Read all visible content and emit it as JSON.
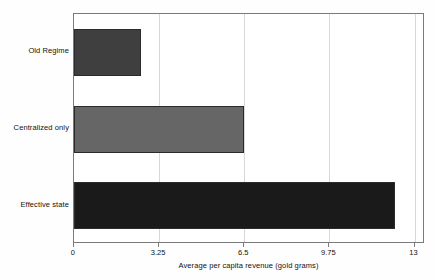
{
  "chart_data": {
    "type": "bar",
    "orientation": "horizontal",
    "title": "",
    "subtitle": "",
    "xlabel": "Average per capita revenue (gold grams)",
    "ylabel": "",
    "categories": [
      "Old Regime",
      "Centralized only",
      "Effective state"
    ],
    "values": [
      2.56,
      6.5,
      12.25
    ],
    "bar_colors": [
      "#3f3f3f",
      "#666666",
      "#1a1a1a"
    ],
    "bar_edge_color": "#2b2b2b",
    "xlim": [
      0,
      13.4
    ],
    "ylim": [
      0,
      3
    ],
    "xticks": [
      0,
      3.25,
      6.5,
      9.75,
      13
    ],
    "xtick_labels": [
      "0",
      "3.25",
      "6.5",
      "9.75",
      "13"
    ],
    "grid": "vertical",
    "gridline_color": "#d8d8d8",
    "legend": "none",
    "legend_position": "none",
    "frame_color": "#7a7a7a",
    "background_color": "#ffffff",
    "annotations": []
  },
  "figure": {
    "x_axis_title": "Average per capita revenue (gold grams)",
    "series": [
      {
        "label": "Old Regime",
        "value": 2.56,
        "color": "#3f3f3f"
      },
      {
        "label": "Centralized only",
        "value": 6.5,
        "color": "#666666"
      },
      {
        "label": "Effective state",
        "value": 12.25,
        "color": "#1a1a1a"
      }
    ],
    "x_ticks": [
      {
        "label": "0",
        "value": 0
      },
      {
        "label": "3.25",
        "value": 3.25
      },
      {
        "label": "6.5",
        "value": 6.5
      },
      {
        "label": "9.75",
        "value": 9.75
      },
      {
        "label": "13",
        "value": 13
      }
    ]
  }
}
